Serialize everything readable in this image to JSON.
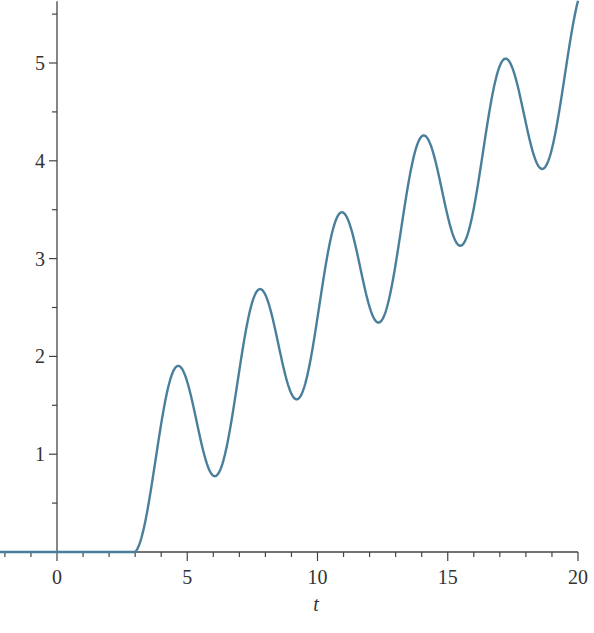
{
  "chart_data": {
    "type": "line",
    "title": "",
    "xlabel": "t",
    "ylabel": "",
    "xlim": [
      -2.2,
      20
    ],
    "ylim": [
      0,
      5.6
    ],
    "x_ticks": [
      0,
      5,
      10,
      15,
      20
    ],
    "x_tick_labels": [
      "0",
      "5",
      "10",
      "15",
      "20"
    ],
    "x_minor_step": 1,
    "y_ticks": [
      1,
      2,
      3,
      4,
      5
    ],
    "y_tick_labels": [
      "1",
      "2",
      "3",
      "4",
      "5"
    ],
    "y_minor_step": 0.5,
    "grid": false,
    "legend": null,
    "line_color": "#4a7f9c",
    "series": [
      {
        "name": "y(t)",
        "description": "zero for t<3, then oscillating ramp ~ (t-3)/4 + 0.75(1 - cos 2(t-3))",
        "points": [
          [
            -2.2,
            0
          ],
          [
            3.0,
            0
          ],
          [
            3.5,
            0.31
          ],
          [
            4.0,
            0.98
          ],
          [
            4.5,
            1.55
          ],
          [
            4.76,
            1.92
          ],
          [
            5.0,
            1.87
          ],
          [
            5.5,
            1.53
          ],
          [
            6.0,
            0.97
          ],
          [
            6.18,
            0.78
          ],
          [
            6.5,
            0.91
          ],
          [
            7.0,
            1.57
          ],
          [
            7.5,
            2.26
          ],
          [
            7.9,
            2.71
          ],
          [
            8.5,
            2.44
          ],
          [
            9.0,
            1.82
          ],
          [
            9.33,
            1.55
          ],
          [
            9.7,
            1.78
          ],
          [
            10.3,
            2.78
          ],
          [
            11.0,
            3.49
          ],
          [
            11.6,
            3.05
          ],
          [
            12.0,
            2.61
          ],
          [
            12.47,
            2.35
          ],
          [
            13.0,
            2.86
          ],
          [
            13.6,
            3.88
          ],
          [
            14.2,
            4.27
          ],
          [
            14.8,
            3.72
          ],
          [
            15.3,
            3.22
          ],
          [
            15.62,
            3.14
          ],
          [
            16.2,
            3.86
          ],
          [
            16.8,
            4.72
          ],
          [
            17.35,
            5.06
          ],
          [
            18.0,
            4.55
          ],
          [
            18.77,
            3.92
          ],
          [
            19.3,
            4.35
          ],
          [
            20.0,
            5.54
          ]
        ]
      }
    ]
  }
}
